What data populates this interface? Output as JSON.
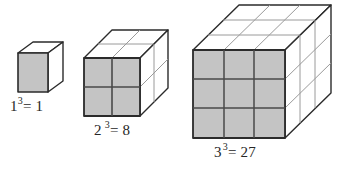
{
  "figure": {
    "background_color": "#ffffff",
    "front_face_color": "#c4c4c4",
    "top_face_color": "#ffffff",
    "side_face_color": "#ffffff",
    "outline_color": "#2b2b2b",
    "inner_line_color": "#5a5a5a",
    "faint_line_color": "#9a9a9a",
    "text_color": "#262626"
  },
  "cubes": [
    {
      "name": "cube-1",
      "edge_units": 1,
      "unit_cube_count": 1,
      "label": {
        "base": "1",
        "exponent": "3",
        "equals": "=",
        "value": "1",
        "full_text": "1³= 1"
      }
    },
    {
      "name": "cube-2",
      "edge_units": 2,
      "unit_cube_count": 8,
      "label": {
        "base": "2",
        "exponent": "3",
        "equals": "=",
        "value": "8",
        "full_text": "2³= 8"
      }
    },
    {
      "name": "cube-3",
      "edge_units": 3,
      "unit_cube_count": 27,
      "label": {
        "base": "3",
        "exponent": "3",
        "equals": "=",
        "value": "27",
        "full_text": "3³= 27"
      }
    }
  ]
}
